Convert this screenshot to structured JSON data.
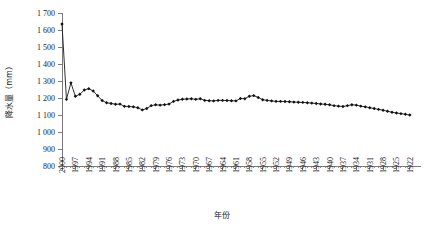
{
  "chart_data": {
    "type": "line",
    "title": "",
    "xlabel": "年份",
    "ylabel": "降水量（mm）",
    "ylim": [
      800,
      1700
    ],
    "ytick_step": 100,
    "yticks": [
      "800",
      "900",
      "1 000",
      "1 100",
      "1 200",
      "1 300",
      "1 400",
      "1 500",
      "1 600",
      "1 700"
    ],
    "grid": false,
    "legend": null,
    "x_axis_direction": "descending",
    "x_tick_interval": 3,
    "xticks": [
      "2000",
      "1997",
      "1994",
      "1991",
      "1988",
      "1985",
      "1982",
      "1979",
      "1976",
      "1973",
      "1970",
      "1967",
      "1964",
      "1961",
      "1958",
      "1955",
      "1952",
      "1949",
      "1946",
      "1943",
      "1940",
      "1937",
      "1934",
      "1931",
      "1928",
      "1925",
      "1922"
    ],
    "marker": "filled-diamond",
    "series": [
      {
        "name": "降水量",
        "x": [
          2000,
          1999,
          1998,
          1997,
          1996,
          1995,
          1994,
          1993,
          1992,
          1991,
          1990,
          1989,
          1988,
          1987,
          1986,
          1985,
          1984,
          1983,
          1982,
          1981,
          1980,
          1979,
          1978,
          1977,
          1976,
          1975,
          1974,
          1973,
          1972,
          1971,
          1970,
          1969,
          1968,
          1967,
          1966,
          1965,
          1964,
          1963,
          1962,
          1961,
          1960,
          1959,
          1958,
          1957,
          1956,
          1955,
          1954,
          1953,
          1952,
          1951,
          1950,
          1949,
          1948,
          1947,
          1946,
          1945,
          1944,
          1943,
          1942,
          1941,
          1940,
          1939,
          1938,
          1937,
          1936,
          1935,
          1934,
          1933,
          1932,
          1931,
          1930,
          1929,
          1928,
          1927,
          1926,
          1925,
          1924,
          1923,
          1922
        ],
        "values": [
          1635,
          1192,
          1289,
          1210,
          1222,
          1247,
          1255,
          1241,
          1213,
          1185,
          1172,
          1168,
          1163,
          1164,
          1151,
          1150,
          1148,
          1143,
          1130,
          1138,
          1155,
          1160,
          1158,
          1161,
          1164,
          1180,
          1188,
          1193,
          1194,
          1196,
          1192,
          1196,
          1186,
          1184,
          1183,
          1186,
          1186,
          1185,
          1184,
          1183,
          1197,
          1196,
          1210,
          1214,
          1203,
          1190,
          1186,
          1183,
          1180,
          1180,
          1179,
          1178,
          1176,
          1175,
          1174,
          1172,
          1170,
          1168,
          1165,
          1163,
          1160,
          1155,
          1152,
          1150,
          1155,
          1160,
          1158,
          1152,
          1148,
          1143,
          1138,
          1133,
          1128,
          1122,
          1116,
          1112,
          1108,
          1104,
          1100
        ]
      }
    ]
  }
}
